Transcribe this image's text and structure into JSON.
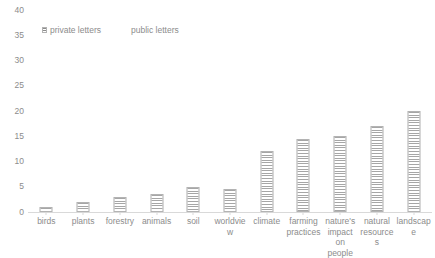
{
  "chart_data": {
    "type": "bar",
    "title": "",
    "subtitle": "",
    "xlabel": "",
    "ylabel": "",
    "ylim": [
      0,
      40
    ],
    "ytick_step": 5,
    "yticks": [
      "40",
      "35",
      "30",
      "25",
      "20",
      "15",
      "10",
      "5",
      "0"
    ],
    "grid": false,
    "legend_position": "top-left",
    "categories": [
      "birds",
      "plants",
      "forestry",
      "animals",
      "soil",
      "worldview",
      "climate",
      "farming practices",
      "nature's impact on people",
      "natural resources",
      "landscape"
    ],
    "series": [
      {
        "name": "private letters",
        "fill": "hatched",
        "color": "#a6a6a6",
        "values": [
          1,
          2,
          3,
          3.5,
          5,
          4.5,
          12,
          14.5,
          15,
          17,
          20
        ]
      },
      {
        "name": "public letters",
        "fill": "plain",
        "color": "#ffffff",
        "values": [
          0,
          0,
          0,
          0,
          0,
          0,
          0,
          0,
          0,
          0,
          0
        ]
      }
    ]
  },
  "legend": {
    "entries": [
      {
        "label": "private letters"
      },
      {
        "label": "public letters"
      }
    ]
  },
  "style": {
    "axis_color": "#d9d9d9",
    "text_color": "#8c8c8c",
    "bar_edge": "#b3b3b3",
    "background": "#ffffff"
  }
}
